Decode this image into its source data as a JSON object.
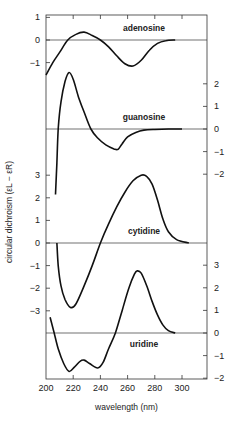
{
  "chart_data": {
    "type": "line",
    "title": "",
    "xlabel": "wavelength (nm)",
    "ylabel": "circular dichroism (εL − εR)",
    "xlim": [
      200,
      318
    ],
    "x_ticks": [
      200,
      220,
      240,
      260,
      280,
      300
    ],
    "grid": false,
    "legend": "none (curves labeled inline)",
    "panels": [
      {
        "name": "adenosine",
        "axis_side": "left",
        "zero_y_px": 40,
        "y_ticks": [
          1,
          0,
          -1
        ],
        "ylim": [
          -1.6,
          1.1
        ],
        "points": [
          [
            200,
            -1.55
          ],
          [
            205,
            -1.0
          ],
          [
            210,
            -0.55
          ],
          [
            216,
            0.0
          ],
          [
            222,
            0.25
          ],
          [
            228,
            0.35
          ],
          [
            234,
            0.2
          ],
          [
            240,
            0.0
          ],
          [
            246,
            -0.3
          ],
          [
            252,
            -0.7
          ],
          [
            258,
            -1.05
          ],
          [
            264,
            -1.15
          ],
          [
            270,
            -0.9
          ],
          [
            276,
            -0.45
          ],
          [
            282,
            -0.15
          ],
          [
            288,
            -0.03
          ],
          [
            295,
            0.0
          ]
        ]
      },
      {
        "name": "guanosine",
        "axis_side": "right",
        "zero_y_px": 129,
        "y_ticks": [
          2,
          1,
          0,
          -1,
          -2
        ],
        "ylim": [
          -2.9,
          2.5
        ],
        "points": [
          [
            207,
            -2.9
          ],
          [
            208,
            -1.5
          ],
          [
            209,
            0.0
          ],
          [
            211,
            1.2
          ],
          [
            214,
            2.1
          ],
          [
            217,
            2.5
          ],
          [
            220,
            2.2
          ],
          [
            224,
            1.4
          ],
          [
            228,
            0.75
          ],
          [
            233,
            0.0
          ],
          [
            238,
            -0.4
          ],
          [
            244,
            -0.7
          ],
          [
            250,
            -0.88
          ],
          [
            253,
            -0.9
          ],
          [
            256,
            -0.65
          ],
          [
            260,
            -0.35
          ],
          [
            266,
            -0.15
          ],
          [
            272,
            -0.05
          ],
          [
            280,
            -0.02
          ],
          [
            290,
            0.0
          ],
          [
            300,
            0.0
          ]
        ]
      },
      {
        "name": "cytidine",
        "axis_side": "left",
        "zero_y_px": 243,
        "y_ticks": [
          3,
          2,
          1,
          0,
          -1,
          -2,
          -3
        ],
        "ylim": [
          -3,
          3
        ],
        "points": [
          [
            208,
            0.0
          ],
          [
            209,
            -1.0
          ],
          [
            211,
            -1.9
          ],
          [
            214,
            -2.5
          ],
          [
            218,
            -2.85
          ],
          [
            222,
            -2.7
          ],
          [
            228,
            -1.9
          ],
          [
            234,
            -1.0
          ],
          [
            240,
            0.0
          ],
          [
            246,
            0.85
          ],
          [
            252,
            1.6
          ],
          [
            258,
            2.25
          ],
          [
            264,
            2.75
          ],
          [
            270,
            3.0
          ],
          [
            274,
            2.95
          ],
          [
            278,
            2.6
          ],
          [
            282,
            1.9
          ],
          [
            286,
            1.05
          ],
          [
            290,
            0.5
          ],
          [
            296,
            0.15
          ],
          [
            305,
            0.0
          ]
        ]
      },
      {
        "name": "uridine",
        "axis_side": "right",
        "zero_y_px": 333,
        "y_ticks": [
          3,
          2,
          1,
          0,
          -1,
          -2
        ],
        "ylim": [
          -2,
          3
        ],
        "points": [
          [
            203,
            0.7
          ],
          [
            206,
            0.0
          ],
          [
            209,
            -0.7
          ],
          [
            213,
            -1.35
          ],
          [
            217,
            -1.7
          ],
          [
            221,
            -1.5
          ],
          [
            225,
            -1.25
          ],
          [
            228,
            -1.2
          ],
          [
            232,
            -1.35
          ],
          [
            238,
            -1.55
          ],
          [
            242,
            -1.3
          ],
          [
            246,
            -0.7
          ],
          [
            251,
            0.0
          ],
          [
            256,
            1.0
          ],
          [
            261,
            2.0
          ],
          [
            265,
            2.6
          ],
          [
            267,
            2.75
          ],
          [
            270,
            2.65
          ],
          [
            274,
            2.1
          ],
          [
            278,
            1.4
          ],
          [
            282,
            0.8
          ],
          [
            286,
            0.35
          ],
          [
            290,
            0.1
          ],
          [
            295,
            0.0
          ]
        ]
      }
    ]
  },
  "labels": {
    "ylabel": "circular dichroism (εL − εR)",
    "xlabel": "wavelength (nm)"
  }
}
